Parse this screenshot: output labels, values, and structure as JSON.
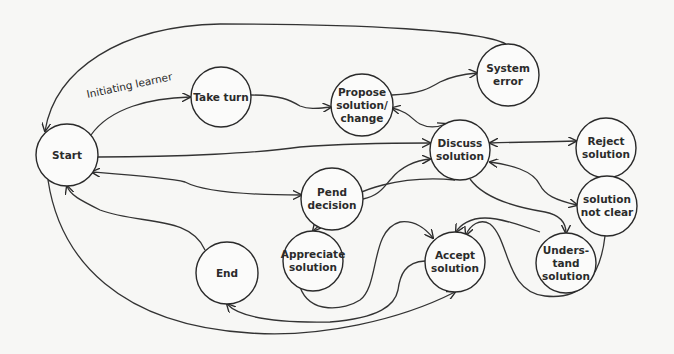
{
  "diagram": {
    "type": "state-transition",
    "background": "#f7f7f5",
    "stroke_color": "#2a2a2a",
    "nodes": [
      {
        "id": "start",
        "label": "Start",
        "cx": 67,
        "cy": 155,
        "r": 31
      },
      {
        "id": "take_turn",
        "label": "Take turn",
        "cx": 221,
        "cy": 97,
        "r": 30
      },
      {
        "id": "propose",
        "label": "Propose\nsolution/\nchange",
        "cx": 362,
        "cy": 105,
        "r": 31
      },
      {
        "id": "system_error",
        "label": "System\nerror",
        "cx": 508,
        "cy": 75,
        "r": 31
      },
      {
        "id": "discuss",
        "label": "Discuss\nsolution",
        "cx": 460,
        "cy": 150,
        "r": 30
      },
      {
        "id": "reject",
        "label": "Reject\nsolution",
        "cx": 606,
        "cy": 148,
        "r": 30
      },
      {
        "id": "pend",
        "label": "Pend\ndecision",
        "cx": 332,
        "cy": 199,
        "r": 31
      },
      {
        "id": "not_clear",
        "label": "solution\nnot clear",
        "cx": 607,
        "cy": 206,
        "r": 30
      },
      {
        "id": "appreciate",
        "label": "Appreciate\nsolution",
        "cx": 313,
        "cy": 261,
        "r": 30
      },
      {
        "id": "accept",
        "label": "Accept\nsolution",
        "cx": 455,
        "cy": 262,
        "r": 30
      },
      {
        "id": "understand",
        "label": "Unders-\ntand\nsolution",
        "cx": 566,
        "cy": 263,
        "r": 30
      },
      {
        "id": "end",
        "label": "End",
        "cx": 227,
        "cy": 273,
        "r": 31
      }
    ],
    "edge_labels": [
      {
        "text": "Initiating learner",
        "x": 88,
        "y": 100,
        "rotate": -12
      }
    ],
    "edges": [
      {
        "from": "start",
        "to": "take_turn",
        "label": "Initiating learner",
        "d": "M 91 135 C 110 108, 150 98, 190 97",
        "arrow_end": true,
        "arrow_start": false
      },
      {
        "from": "take_turn",
        "to": "propose",
        "d": "M 251 95 C 280 95, 290 100, 300 106 C 310 110, 320 108, 331 107",
        "arrow_end": true,
        "arrow_start": false
      },
      {
        "from": "propose",
        "to": "system_error",
        "d": "M 392 95 C 420 94, 430 88, 440 82 C 452 76, 465 74, 477 73",
        "arrow_end": true,
        "arrow_start": false
      },
      {
        "from": "system_error",
        "to": "start",
        "d": "M 506 44 C 480 30, 360 24, 220 24 C 120 26, 55 70, 45 131",
        "arrow_end": true,
        "arrow_start": false
      },
      {
        "from": "propose",
        "to": "discuss",
        "d": "M 392 108 C 410 112, 412 120, 420 124 C 428 128, 436 128, 446 124",
        "arrow_end": true,
        "arrow_start": true
      },
      {
        "from": "start",
        "to": "discuss",
        "d": "M 98 157 C 180 157, 260 153, 300 147 C 340 144, 390 143, 430 143",
        "arrow_end": true,
        "arrow_start": false
      },
      {
        "from": "discuss",
        "to": "reject",
        "d": "M 490 143 C 520 142, 545 142, 576 141",
        "arrow_end": true,
        "arrow_start": true
      },
      {
        "from": "pend",
        "to": "discuss",
        "d": "M 363 199 C 380 196, 385 185, 392 178 C 400 168, 415 160, 430 159",
        "arrow_end": true,
        "arrow_start": false
      },
      {
        "from": "start",
        "to": "pend",
        "d": "M 92 172 C 130 175, 170 178, 185 182 C 200 190, 240 195, 301 195",
        "arrow_end": true,
        "arrow_start": true
      },
      {
        "from": "discuss",
        "to": "appreciate",
        "d": "M 455 180 C 400 175, 355 190, 343 205 C 330 220, 318 225, 313 231",
        "arrow_end": true,
        "arrow_start": false
      },
      {
        "from": "not_clear",
        "to": "discuss",
        "d": "M 577 205 C 555 200, 545 195, 540 185 C 533 170, 510 165, 490 162",
        "arrow_end": true,
        "arrow_start": true
      },
      {
        "from": "discuss",
        "to": "understand",
        "d": "M 470 179 C 485 200, 520 208, 545 212 C 560 215, 566 222, 566 233",
        "arrow_end": true,
        "arrow_start": false
      },
      {
        "from": "understand",
        "to": "accept",
        "d": "M 540 232 C 520 225, 500 218, 485 218 C 470 218, 460 225, 456 232",
        "arrow_end": true,
        "arrow_start": false
      },
      {
        "from": "not_clear",
        "to": "accept",
        "d": "M 605 236 C 600 280, 580 300, 545 296 C 505 292, 510 240, 490 224 C 480 218, 470 225, 466 235",
        "arrow_end": true,
        "arrow_start": false
      },
      {
        "from": "appreciate",
        "to": "accept",
        "d": "M 300 287 C 310 315, 345 310, 360 300 C 380 285, 370 230, 400 222 C 415 220, 425 228, 433 238",
        "arrow_end": true,
        "arrow_start": false
      },
      {
        "from": "accept",
        "to": "end",
        "d": "M 425 261 C 405 262, 400 275, 398 290 C 395 305, 380 318, 330 322 C 280 323, 240 318, 227 304",
        "arrow_end": true,
        "arrow_start": false
      },
      {
        "from": "start",
        "to": "accept",
        "d": "M 48 180 C 60 260, 120 325, 250 333 C 320 338, 400 320, 455 292",
        "arrow_end": true,
        "arrow_start": false
      },
      {
        "from": "end",
        "to": "start",
        "d": "M 205 250 C 190 215, 140 225, 100 210 C 80 200, 70 195, 67 186",
        "arrow_end": true,
        "arrow_start": false
      }
    ]
  }
}
